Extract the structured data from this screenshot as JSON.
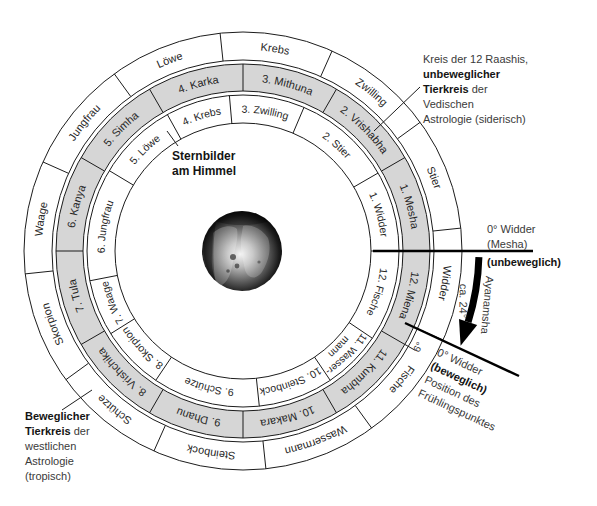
{
  "rings": [
    {
      "key": "tropical",
      "segments": [
        {
          "label": "Widder",
          "start": -24,
          "end": 6
        },
        {
          "label": "Stier",
          "start": 6,
          "end": 36
        },
        {
          "label": "Zwilling",
          "start": 36,
          "end": 66
        },
        {
          "label": "Krebs",
          "start": 66,
          "end": 96
        },
        {
          "label": "Löwe",
          "start": 96,
          "end": 126
        },
        {
          "label": "Jungfrau",
          "start": 126,
          "end": 156
        },
        {
          "label": "Waage",
          "start": 156,
          "end": 186
        },
        {
          "label": "Skorpion",
          "start": 186,
          "end": 216
        },
        {
          "label": "Schütze",
          "start": 216,
          "end": 246
        },
        {
          "label": "Steinbock",
          "start": 246,
          "end": 276
        },
        {
          "label": "Wassermann",
          "start": 276,
          "end": 306
        },
        {
          "label": "Fische",
          "start": 306,
          "end": 336
        }
      ]
    },
    {
      "key": "raashis",
      "segments": [
        {
          "label": "1. Mesha",
          "start": 0,
          "end": 30
        },
        {
          "label": "2. Vrishabha",
          "start": 30,
          "end": 60
        },
        {
          "label": "3. Mithuna",
          "start": 60,
          "end": 90
        },
        {
          "label": "4. Karka",
          "start": 90,
          "end": 120
        },
        {
          "label": "5. Simha",
          "start": 120,
          "end": 150
        },
        {
          "label": "6. Kanya",
          "start": 150,
          "end": 180
        },
        {
          "label": "7. Tula",
          "start": 180,
          "end": 210
        },
        {
          "label": "8. Vrishchika",
          "start": 210,
          "end": 240
        },
        {
          "label": "9. Dhanu",
          "start": 240,
          "end": 270
        },
        {
          "label": "10. Makara",
          "start": 270,
          "end": 300
        },
        {
          "label": "11. Kumbha",
          "start": 300,
          "end": 330
        },
        {
          "label": "12. Miena",
          "start": 330,
          "end": 360
        }
      ]
    },
    {
      "key": "sternbilder",
      "segments": [
        {
          "label": "1. Widder",
          "start": 0,
          "end": 30
        },
        {
          "label": "2. Stier",
          "start": 30,
          "end": 67
        },
        {
          "label": "3. Zwilling",
          "start": 67,
          "end": 95
        },
        {
          "label": "4. Krebs",
          "start": 95,
          "end": 119
        },
        {
          "label": "5. Löwe",
          "start": 119,
          "end": 149
        },
        {
          "label": "6. Jungfrau",
          "start": 149,
          "end": 191
        },
        {
          "label": "7. Waage",
          "start": 191,
          "end": 212
        },
        {
          "label": "8. Skorpion",
          "start": 212,
          "end": 236
        },
        {
          "label": "9. Schütze",
          "start": 236,
          "end": 276
        },
        {
          "label": "10. Steinbock",
          "start": 276,
          "end": 304
        },
        {
          "lines": [
            "11. Wasser-",
            "mann"
          ],
          "start": 304,
          "end": 326
        },
        {
          "label": "12. Fische",
          "start": 326,
          "end": 360
        }
      ]
    }
  ],
  "annotations": {
    "raashi_circle": {
      "lines": [
        {
          "text": "Kreis der 12 Raashis,"
        },
        {
          "bold": "unbeweglicher"
        },
        {
          "bold": "Tierkreis",
          "text": " der"
        },
        {
          "text": "Vedischen"
        },
        {
          "text": "Astrologie (siderisch)"
        }
      ]
    },
    "constellations": {
      "lines": [
        {
          "bold": "Sternbilder"
        },
        {
          "bold": "am Himmel"
        }
      ]
    },
    "tropical_zodiac": {
      "lines": [
        {
          "bold": "Beweglicher"
        },
        {
          "bold": "Tierkreis",
          "text": " der"
        },
        {
          "text": "westlichen"
        },
        {
          "text": "Astrologie"
        },
        {
          "text": "(tropisch)"
        }
      ]
    },
    "fixed_zero_point": {
      "lines": [
        {
          "text": "0° Widder"
        },
        {
          "text": "(Mesha)"
        }
      ],
      "status": "(unbeweglich)"
    },
    "movable_zero_point": {
      "lines": [
        {
          "text": "0° Widder"
        },
        {
          "bold": "(beweglich)"
        },
        {
          "text": "Position des"
        },
        {
          "text": "Frühlingspunktes"
        }
      ]
    },
    "ayanamsha": {
      "label": "Ayanamsha",
      "value": "ca. 24°"
    },
    "offset_label": "6°"
  },
  "colors": {
    "raashi_ring_fill": "#d6d6d6",
    "line": "#1c1c1c",
    "marker": "#000000"
  }
}
